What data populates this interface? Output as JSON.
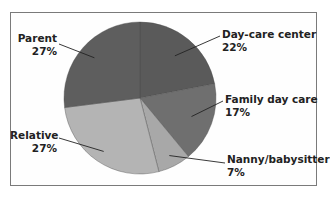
{
  "chart_data": {
    "type": "pie",
    "title": "",
    "categories": [
      "Day-care center",
      "Family day care",
      "Nanny/babysitter",
      "Relative",
      "Parent"
    ],
    "values": [
      22,
      17,
      7,
      27,
      27
    ],
    "unit": "%",
    "colors": [
      "#5a5a5a",
      "#6f6f6f",
      "#a8a8a8",
      "#b4b4b4",
      "#5e5e5e"
    ],
    "start_angle_deg": 0,
    "direction": "clockwise",
    "labels": [
      {
        "name": "Day-care center",
        "pct": "22%"
      },
      {
        "name": "Family day care",
        "pct": "17%"
      },
      {
        "name": "Nanny/babysitter",
        "pct": "7%"
      },
      {
        "name": "Relative",
        "pct": "27%"
      },
      {
        "name": "Parent",
        "pct": "27%"
      }
    ],
    "legend": "none (direct labels with leader lines)"
  }
}
